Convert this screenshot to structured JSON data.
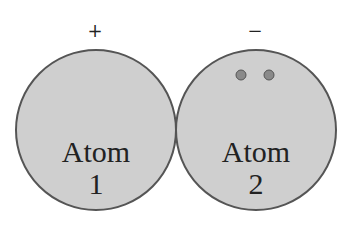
{
  "atoms": [
    {
      "name": "Atom",
      "number": "1",
      "charge": "+"
    },
    {
      "name": "Atom",
      "number": "2",
      "charge": "−"
    }
  ],
  "colors": {
    "fill": "#cfcfcf",
    "stroke": "#555555",
    "electron": "#7a7a7a"
  }
}
